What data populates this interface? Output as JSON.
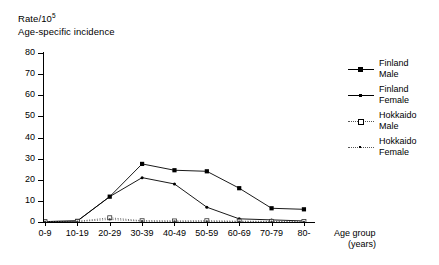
{
  "title": {
    "line1_prefix": "Rate/10",
    "line1_sup": "5",
    "line2": "Age-specific incidence"
  },
  "legend": {
    "position": "right",
    "entries": [
      {
        "name": "Finland",
        "sub": "Male",
        "marker": "filled-square",
        "line": "solid"
      },
      {
        "name": "Finland",
        "sub": "Female",
        "marker": "filled-dot",
        "line": "solid"
      },
      {
        "name": "Hokkaido",
        "sub": "Male",
        "marker": "open-square",
        "line": "dotted"
      },
      {
        "name": "Hokkaido",
        "sub": "Female",
        "marker": "small-dot",
        "line": "dotted"
      }
    ]
  },
  "xaxis_title": {
    "line1": "Age group",
    "line2": "(years)"
  },
  "chart_data": {
    "type": "line",
    "title": "Age-specific incidence",
    "xlabel": "Age group (years)",
    "ylabel": "Rate/10^5",
    "ylim": [
      0,
      80
    ],
    "yticks": [
      0,
      10,
      20,
      30,
      40,
      50,
      60,
      70,
      80
    ],
    "grid": false,
    "legend_position": "right",
    "categories": [
      "0-9",
      "10-19",
      "20-29",
      "30-39",
      "40-49",
      "50-59",
      "60-69",
      "70-79",
      "80-"
    ],
    "series": [
      {
        "name": "Finland Male",
        "values": [
          0.2,
          0.5,
          12.0,
          27.5,
          24.5,
          24.0,
          16.0,
          6.5,
          6.0
        ]
      },
      {
        "name": "Finland Female",
        "values": [
          0.2,
          0.5,
          12.0,
          21.0,
          18.0,
          7.0,
          1.5,
          1.0,
          0.5
        ]
      },
      {
        "name": "Hokkaido Male",
        "values": [
          0.1,
          0.3,
          2.0,
          0.6,
          0.5,
          0.6,
          0.4,
          0.3,
          0.2
        ]
      },
      {
        "name": "Hokkaido Female",
        "values": [
          0.1,
          0.2,
          1.2,
          0.4,
          0.3,
          0.3,
          0.2,
          0.2,
          0.1
        ]
      }
    ]
  }
}
